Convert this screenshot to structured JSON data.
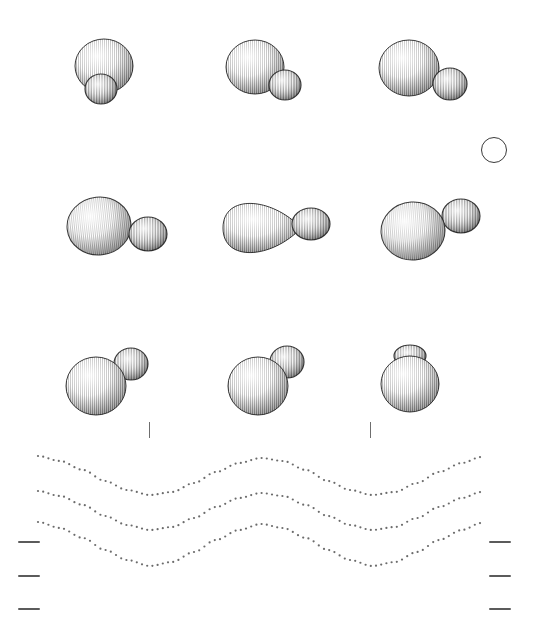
{
  "figure": {
    "canvas": {
      "width": 534,
      "height": 636,
      "background": "#ffffff"
    },
    "corner_label": "",
    "ink_color": "#1a1a1a",
    "stipple_color": "#2b2b2b",
    "tick_color": "#5b5b5b",
    "curve_dot_color": "#6b6b6b"
  },
  "chart_data": {
    "type": "scatter",
    "xlabel": "",
    "ylabel": "",
    "xlim": [
      0,
      534
    ],
    "ylim": [
      0,
      636
    ],
    "grid": false,
    "legend": "none",
    "rows": [
      {
        "row_index": 1,
        "row_label": "row-1",
        "center_y": 75,
        "items": [
          {
            "id": "r1c1",
            "label": "vertical-pair-overlap",
            "cx": 105,
            "cy": 72,
            "big": {
              "cx": 104,
              "cy": 66,
              "rx": 29,
              "ry": 27,
              "rotate": 0,
              "shade": "vertical-hatch"
            },
            "small": {
              "cx": 101,
              "cy": 89,
              "rx": 16,
              "ry": 15,
              "rotate": 0,
              "shade": "vertical-hatch"
            },
            "arrangement": "small-below-big"
          },
          {
            "id": "r1c2",
            "label": "diagonal-pair-lower-right",
            "cx": 265,
            "cy": 72,
            "big": {
              "cx": 255,
              "cy": 67,
              "rx": 29,
              "ry": 27,
              "rotate": 0,
              "shade": "vertical-hatch"
            },
            "small": {
              "cx": 285,
              "cy": 85,
              "rx": 16,
              "ry": 15,
              "rotate": 0,
              "shade": "vertical-hatch"
            },
            "arrangement": "small-lower-right"
          },
          {
            "id": "r1c3",
            "label": "diagonal-pair-right",
            "cx": 420,
            "cy": 72,
            "big": {
              "cx": 409,
              "cy": 68,
              "rx": 30,
              "ry": 28,
              "rotate": 0,
              "shade": "vertical-hatch"
            },
            "small": {
              "cx": 450,
              "cy": 84,
              "rx": 17,
              "ry": 16,
              "rotate": 0,
              "shade": "vertical-hatch"
            },
            "arrangement": "small-right"
          }
        ]
      },
      {
        "row_index": 2,
        "row_label": "row-2",
        "center_y": 228,
        "items": [
          {
            "id": "r2c1",
            "label": "horizontal-pair-touching",
            "cx": 105,
            "cy": 228,
            "big": {
              "cx": 99,
              "cy": 226,
              "rx": 32,
              "ry": 29,
              "rotate": -6,
              "shade": "vertical-hatch"
            },
            "small": {
              "cx": 148,
              "cy": 234,
              "rx": 19,
              "ry": 17,
              "rotate": 0,
              "shade": "vertical-hatch"
            },
            "arrangement": "side-by-side"
          },
          {
            "id": "r2c2",
            "label": "teardrop-and-ellipse",
            "cx": 268,
            "cy": 228,
            "big": {
              "cx": 257,
              "cy": 228,
              "rx": 34,
              "ry": 28,
              "rotate": 0,
              "shade": "vertical-hatch",
              "form": "teardrop-right"
            },
            "small": {
              "cx": 311,
              "cy": 224,
              "rx": 19,
              "ry": 16,
              "rotate": 0,
              "shade": "vertical-hatch",
              "form": "ellipse"
            },
            "arrangement": "detached-pair"
          },
          {
            "id": "r2c3",
            "label": "horizontal-pair-raised-small",
            "cx": 424,
            "cy": 228,
            "big": {
              "cx": 413,
              "cy": 231,
              "rx": 32,
              "ry": 29,
              "rotate": -4,
              "shade": "vertical-hatch"
            },
            "small": {
              "cx": 461,
              "cy": 216,
              "rx": 19,
              "ry": 17,
              "rotate": 0,
              "shade": "vertical-hatch"
            },
            "arrangement": "small-upper-right"
          }
        ]
      },
      {
        "row_index": 3,
        "row_label": "row-3",
        "center_y": 380,
        "items": [
          {
            "id": "r3c1",
            "label": "small-upper-right-detached",
            "cx": 105,
            "cy": 380,
            "big": {
              "cx": 96,
              "cy": 386,
              "rx": 30,
              "ry": 29,
              "rotate": 0,
              "shade": "vertical-hatch"
            },
            "small": {
              "cx": 131,
              "cy": 364,
              "rx": 17,
              "ry": 16,
              "rotate": 0,
              "shade": "vertical-hatch"
            },
            "arrangement": "small-upper-right"
          },
          {
            "id": "r3c2",
            "label": "small-overlapping-upper-right",
            "cx": 265,
            "cy": 380,
            "big": {
              "cx": 258,
              "cy": 386,
              "rx": 30,
              "ry": 29,
              "rotate": 0,
              "shade": "vertical-hatch"
            },
            "small": {
              "cx": 287,
              "cy": 362,
              "rx": 17,
              "ry": 16,
              "rotate": 0,
              "shade": "vertical-hatch"
            },
            "arrangement": "small-overlap-upper-right"
          },
          {
            "id": "r3c3",
            "label": "capped-sphere",
            "cx": 412,
            "cy": 380,
            "big": {
              "cx": 410,
              "cy": 384,
              "rx": 29,
              "ry": 28,
              "rotate": 0,
              "shade": "vertical-hatch"
            },
            "small": {
              "cx": 410,
              "cy": 356,
              "rx": 16,
              "ry": 11,
              "rotate": 0,
              "shade": "vertical-hatch"
            },
            "arrangement": "small-cap-on-top"
          }
        ]
      }
    ],
    "reference_circle": {
      "label": "reference-circle",
      "cx": 494,
      "cy": 150,
      "r": 13,
      "filled": false,
      "stroke": "#3a3a3a"
    },
    "vertical_ticks": [
      {
        "label": "tick-v-1",
        "x": 149,
        "y": 422,
        "length": 16
      },
      {
        "label": "tick-v-2",
        "x": 370,
        "y": 422,
        "length": 16
      }
    ],
    "left_ticks": [
      {
        "label": "tick-left-1",
        "x": 18,
        "y": 541,
        "width": 22
      },
      {
        "label": "tick-left-2",
        "x": 18,
        "y": 575,
        "width": 22
      },
      {
        "label": "tick-left-3",
        "x": 18,
        "y": 608,
        "width": 22
      }
    ],
    "right_ticks": [
      {
        "label": "tick-right-1",
        "x": 489,
        "y": 541,
        "width": 22
      },
      {
        "label": "tick-right-2",
        "x": 489,
        "y": 575,
        "width": 22
      },
      {
        "label": "tick-right-3",
        "x": 489,
        "y": 608,
        "width": 22
      }
    ],
    "dotted_curves": [
      {
        "label": "dotted-wave-top",
        "series_name": "wave-1",
        "x_start": 38,
        "x_end": 481,
        "baseline_y": 458,
        "amplitude": 20,
        "wavelength": 222,
        "phase": 0,
        "dot_spacing": 5.2,
        "dot_radius": 1.1,
        "points_x": [
          38,
          60,
          83,
          105,
          127,
          150,
          172,
          194,
          216,
          239,
          261,
          283,
          306,
          328,
          350,
          372,
          395,
          417,
          439,
          462,
          481
        ],
        "points_y": [
          456,
          461,
          470,
          481,
          490,
          495,
          492,
          483,
          472,
          463,
          458,
          461,
          470,
          481,
          490,
          495,
          492,
          483,
          472,
          463,
          457
        ]
      },
      {
        "label": "dotted-wave-middle",
        "series_name": "wave-2",
        "x_start": 38,
        "x_end": 481,
        "baseline_y": 493,
        "amplitude": 20,
        "wavelength": 222,
        "phase": 0,
        "dot_spacing": 5.2,
        "dot_radius": 1.1,
        "points_x": [
          38,
          60,
          83,
          105,
          127,
          150,
          172,
          194,
          216,
          239,
          261,
          283,
          306,
          328,
          350,
          372,
          395,
          417,
          439,
          462,
          481
        ],
        "points_y": [
          491,
          496,
          505,
          516,
          525,
          530,
          527,
          518,
          507,
          498,
          493,
          496,
          505,
          516,
          525,
          530,
          527,
          518,
          507,
          498,
          492
        ]
      },
      {
        "label": "dotted-wave-bottom",
        "series_name": "wave-3",
        "x_start": 38,
        "x_end": 481,
        "baseline_y": 524,
        "amplitude": 22,
        "wavelength": 222,
        "phase": 0,
        "dot_spacing": 5.2,
        "dot_radius": 1.1,
        "points_x": [
          38,
          60,
          83,
          105,
          127,
          150,
          172,
          194,
          216,
          239,
          261,
          283,
          306,
          328,
          350,
          372,
          395,
          417,
          439,
          462,
          481
        ],
        "points_y": [
          522,
          528,
          538,
          550,
          560,
          566,
          562,
          552,
          540,
          530,
          524,
          528,
          538,
          550,
          560,
          566,
          562,
          552,
          540,
          530,
          523
        ]
      }
    ]
  }
}
